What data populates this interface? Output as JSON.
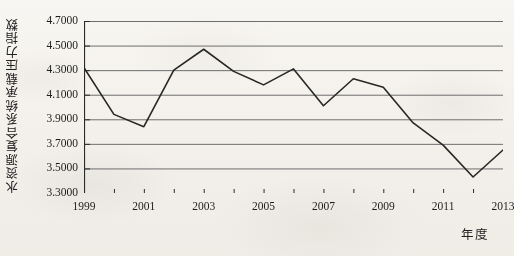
{
  "chart_data": {
    "type": "line",
    "title": "",
    "subtitle": "",
    "xlabel": "年度",
    "ylabel": "水资源复合系统承载压力指数",
    "x": [
      1999,
      2000,
      2001,
      2002,
      2003,
      2004,
      2005,
      2006,
      2007,
      2008,
      2009,
      2010,
      2011,
      2012,
      2013
    ],
    "values": [
      4.32,
      3.94,
      3.84,
      4.3,
      4.47,
      4.29,
      4.18,
      4.31,
      4.01,
      4.23,
      4.16,
      3.87,
      3.69,
      3.43,
      3.65
    ],
    "series": [
      {
        "name": "水资源复合系统承载压力指数",
        "values": [
          4.32,
          3.94,
          3.84,
          4.3,
          4.47,
          4.29,
          4.18,
          4.31,
          4.01,
          4.23,
          4.16,
          3.87,
          3.69,
          3.43,
          3.65
        ]
      }
    ],
    "ylim": [
      3.3,
      4.7
    ],
    "xlim": [
      1999,
      2013
    ],
    "ytick_labels": [
      "4.7000",
      "4.5000",
      "4.3000",
      "4.1000",
      "3.9000",
      "3.7000",
      "3.5000",
      "3.3000"
    ],
    "ytick_values": [
      4.7,
      4.5,
      4.3,
      4.1,
      3.9,
      3.7,
      3.5,
      3.3
    ],
    "xtick_labels": [
      "1999",
      "2001",
      "2003",
      "2005",
      "2007",
      "2009",
      "2011",
      "2013"
    ],
    "xtick_values": [
      1999,
      2001,
      2003,
      2005,
      2007,
      2009,
      2011,
      2013
    ],
    "grid": "horizontal",
    "legend": "none",
    "line_color": "#272727",
    "grid_color": "#6e6e6e",
    "axis_color": "#2a2a2a",
    "background_color": "#faf8f5"
  }
}
